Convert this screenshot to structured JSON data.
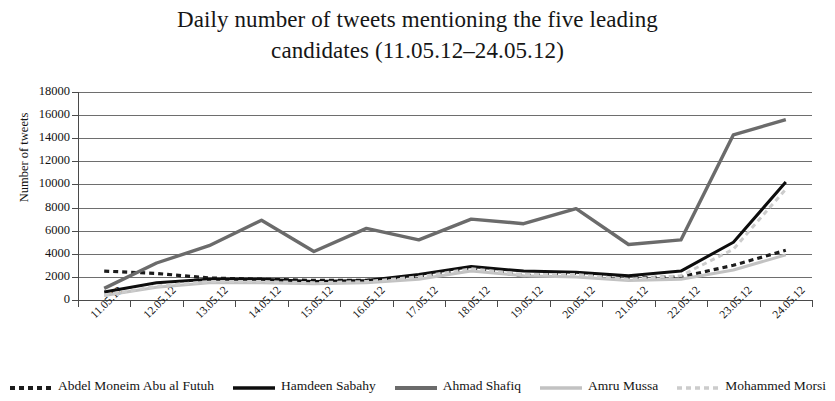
{
  "chart_data": {
    "type": "line",
    "title": "Daily number of tweets mentioning the five leading candidates (11.05.12–24.05.12)",
    "title_line1": "Daily number of tweets mentioning the five leading",
    "title_line2": "candidates (11.05.12–24.05.12)",
    "xlabel": "",
    "ylabel": "Number of tweets",
    "ylim": [
      0,
      18000
    ],
    "ytick_step": 2000,
    "ytick_labels": [
      "18000",
      "16000",
      "14000",
      "12000",
      "10000",
      "8000",
      "6000",
      "4000",
      "2000",
      "0"
    ],
    "ytick_values": [
      18000,
      16000,
      14000,
      12000,
      10000,
      8000,
      6000,
      4000,
      2000,
      0
    ],
    "grid": "horizontal",
    "legend_position": "bottom",
    "categories": [
      "11.05.12",
      "12.05.12",
      "13.05.12",
      "14.05.12",
      "15.05.12",
      "16.05.12",
      "17.05.12",
      "18.05.12",
      "19.05.12",
      "20.05.12",
      "21.05.12",
      "22.05.12",
      "23.05.12",
      "24.05.12"
    ],
    "series": [
      {
        "name": "Abdel Moneim Abu al Futuh",
        "style": "dashed",
        "color": "#1c1c1c",
        "width": 3.2,
        "values": [
          2500,
          2300,
          1900,
          1800,
          1700,
          1700,
          2000,
          2700,
          2100,
          2300,
          1900,
          2000,
          3000,
          4300
        ]
      },
      {
        "name": "Hamdeen Sabahy",
        "style": "solid",
        "color": "#0d0d0d",
        "width": 3.0,
        "values": [
          700,
          1500,
          1800,
          1800,
          1600,
          1700,
          2200,
          2900,
          2500,
          2400,
          2100,
          2500,
          5000,
          10200
        ]
      },
      {
        "name": "Ahmad Shafiq",
        "style": "solid",
        "color": "#6b6b6b",
        "width": 3.4,
        "values": [
          1000,
          3200,
          4700,
          6900,
          4200,
          6200,
          5200,
          7000,
          6600,
          7900,
          4800,
          5200,
          14300,
          15600
        ]
      },
      {
        "name": "Amru Mussa",
        "style": "solid",
        "color": "#c2c2c2",
        "width": 3.0,
        "values": [
          400,
          1100,
          1500,
          1500,
          1400,
          1500,
          1800,
          2500,
          2100,
          2000,
          1700,
          1800,
          2600,
          3900
        ]
      },
      {
        "name": "Mohammed Morsi",
        "style": "dashed",
        "color": "#cccccc",
        "width": 3.0,
        "values": [
          400,
          1200,
          1600,
          1600,
          1500,
          1600,
          2000,
          2700,
          2200,
          2200,
          1800,
          2100,
          4400,
          9600
        ]
      }
    ]
  },
  "legend": {
    "items": [
      {
        "label": "Abdel Moneim Abu al Futuh",
        "key": "dashed-dark"
      },
      {
        "label": "Hamdeen Sabahy",
        "key": "solid-dark"
      },
      {
        "label": "Ahmad Shafiq",
        "key": "solid-gray"
      },
      {
        "label": "Amru Mussa",
        "key": "solid-lightgray"
      },
      {
        "label": "Mohammed Morsi",
        "key": "dashed-lightgray"
      }
    ]
  }
}
